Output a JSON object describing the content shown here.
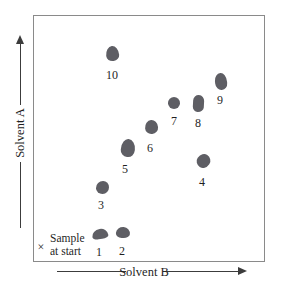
{
  "figure": {
    "axes": {
      "y_label": "Solvent A",
      "x_label": "Solvent B"
    },
    "sample_marker": {
      "symbol": "×",
      "line1": "Sample",
      "line2": "at start"
    },
    "spots": [
      {
        "label": "1",
        "cx": 100,
        "cy": 234,
        "w": 16,
        "h": 10,
        "lx": 99,
        "ly": 252
      },
      {
        "label": "2",
        "cx": 123,
        "cy": 232,
        "w": 14,
        "h": 11,
        "lx": 122,
        "ly": 251
      },
      {
        "label": "3",
        "cx": 102,
        "cy": 187,
        "w": 13,
        "h": 13,
        "lx": 101,
        "ly": 205
      },
      {
        "label": "4",
        "cx": 203,
        "cy": 161,
        "w": 13,
        "h": 14,
        "lx": 202,
        "ly": 182
      },
      {
        "label": "5",
        "cx": 128,
        "cy": 148,
        "w": 14,
        "h": 18,
        "lx": 125,
        "ly": 169
      },
      {
        "label": "6",
        "cx": 151,
        "cy": 127,
        "w": 13,
        "h": 14,
        "lx": 150,
        "ly": 148
      },
      {
        "label": "7",
        "cx": 174,
        "cy": 103,
        "w": 12,
        "h": 12,
        "lx": 174,
        "ly": 121
      },
      {
        "label": "8",
        "cx": 198,
        "cy": 103,
        "w": 11,
        "h": 17,
        "lx": 198,
        "ly": 123
      },
      {
        "label": "9",
        "cx": 221,
        "cy": 81,
        "w": 12,
        "h": 17,
        "lx": 220,
        "ly": 100
      },
      {
        "label": "10",
        "cx": 112,
        "cy": 53,
        "w": 13,
        "h": 15,
        "lx": 112,
        "ly": 75
      }
    ],
    "colors": {
      "spot": "#5e5e64",
      "axis_line": "#3c3c3c",
      "plate_border": "#8a8a8a",
      "text": "#1f1f1f",
      "background": "#ffffff"
    }
  }
}
